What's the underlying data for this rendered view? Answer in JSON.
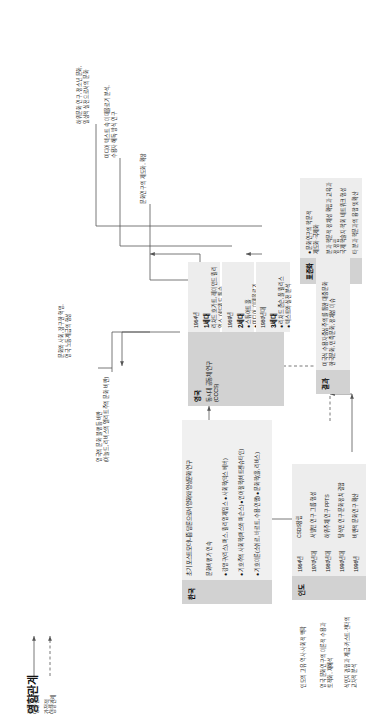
{
  "title": "영향관계",
  "legend": {
    "direct": "직접적\n영향관계",
    "indirect": "간접적\n영향관계"
  },
  "uk": {
    "label": "영국",
    "sub": "동시대 공동체 연구\n(CCCS)",
    "generations": [
      {
        "year": "1964년",
        "gen": "1세대",
        "items": "리처드 호가트, 레이먼드 윌리엄스, 에드워드 톰슨"
      },
      {
        "year": "1969년",
        "gen": "2세대",
        "items": "● 스튜어트 홀\n● 미디어, 이데올로기"
      },
      {
        "year": "1980년대",
        "gen": "3세대",
        "items": "● 리처드 존슨, 폴 윌리스\n● 텍스트와 실천 분석"
      }
    ],
    "notes": [
      "영국의 문화 불평등 비판\n(아놀드, 리비스의 엘리트주의 문화 비판)",
      "문화와 사회, 장구한 혁명,\n영국 노동계급의 형성",
      "문화연구의 제도화, 확장",
      "미디어 텍스트 속 이데올로기 분석,\n수용자 해독 방식 연구",
      "하위문화 연구, 청소년 문화,\n일상적 실천으로서의 문화"
    ]
  },
  "standardization": {
    "label": "표준화",
    "items": "● 문화연구의 학문적\n  제도화·국제화",
    "notes": [
      "분과 학문적 정체성 확립과 교육과정 정립",
      "국제 학술지·학회 네트워크 형성",
      "타 분과 학문과의 융합 및 확산"
    ]
  },
  "india": {
    "label": "인도",
    "generations": [
      {
        "year": "1964년",
        "text": "CSDS창립"
      },
      {
        "year": "1970년대",
        "text": "서발턴 연구 그룹 형성"
      },
      {
        "year": "1980년대",
        "text": "하위주체 연구 PPTS"
      },
      {
        "year": "1990년대",
        "text": "탈식민 연구·문화정치 결합"
      },
      {
        "year": "1996년",
        "text": "비판적 문화연구 확산"
      }
    ],
    "notes": [
      "인도의 고유 역사·사회적 맥락",
      "영국 문화연구의 이론적 수용과\n토착화, 재해석",
      "식민지 경험과 계급·카스트·젠더의\n교차적 분석"
    ]
  },
  "korea": {
    "label": "한국",
    "heading": "초기 포스트모더니즘 담론으로서 영화와 영상문화 연구",
    "subheading": "문화비평가 연속",
    "items": [
      "● 강명구(리스), 퍼스, 윌리엄 제임스 ● 사회학(막스 베버)",
      "● 기호주의 사회학(퍼스와 파슨스) ● 언어철학(비트겐슈타인)",
      "● 기호이론(소쉬르, 바르트, 수용·연행) ● 문화학(홀, 리비스)"
    ],
    "result": "결과",
    "result_text": "미국식 수용자중심주의를 통한 대중문화\n한국문화, 민족문화, 정체성 이슈"
  },
  "colors": {
    "box_dark": "#d2d2d2",
    "box_mid": "#e6e6e6",
    "box_light": "#ededed",
    "line": "#555555",
    "text": "#111111"
  }
}
